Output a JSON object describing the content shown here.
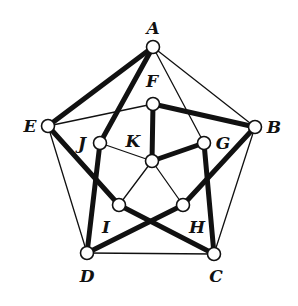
{
  "diagram": {
    "type": "graph",
    "nodes": [
      {
        "id": "A",
        "label": "A",
        "x": 153,
        "y": 47,
        "lx": 153,
        "ly": 29
      },
      {
        "id": "B",
        "label": "B",
        "x": 255,
        "y": 127,
        "lx": 274,
        "ly": 128
      },
      {
        "id": "C",
        "label": "C",
        "x": 214,
        "y": 254,
        "lx": 216,
        "ly": 277
      },
      {
        "id": "D",
        "label": "D",
        "x": 87,
        "y": 253,
        "lx": 87,
        "ly": 277
      },
      {
        "id": "E",
        "label": "E",
        "x": 48,
        "y": 126,
        "lx": 30,
        "ly": 127
      },
      {
        "id": "F",
        "label": "F",
        "x": 153,
        "y": 104,
        "lx": 152,
        "ly": 82
      },
      {
        "id": "G",
        "label": "G",
        "x": 204,
        "y": 143,
        "lx": 223,
        "ly": 144
      },
      {
        "id": "H",
        "label": "H",
        "x": 183,
        "y": 205,
        "lx": 197,
        "ly": 228
      },
      {
        "id": "I",
        "label": "I",
        "x": 119,
        "y": 205,
        "lx": 106,
        "ly": 228
      },
      {
        "id": "J",
        "label": "J",
        "x": 100,
        "y": 143,
        "lx": 82,
        "ly": 144
      },
      {
        "id": "K",
        "label": "K",
        "x": 152,
        "y": 161,
        "lx": 133,
        "ly": 142
      }
    ],
    "edges": [
      {
        "from": "A",
        "to": "E",
        "weight": "thick"
      },
      {
        "from": "A",
        "to": "J",
        "weight": "thick"
      },
      {
        "from": "F",
        "to": "B",
        "weight": "thick"
      },
      {
        "from": "F",
        "to": "K",
        "weight": "thick"
      },
      {
        "from": "K",
        "to": "G",
        "weight": "thick"
      },
      {
        "from": "E",
        "to": "I",
        "weight": "thick"
      },
      {
        "from": "I",
        "to": "C",
        "weight": "thick"
      },
      {
        "from": "J",
        "to": "D",
        "weight": "thick"
      },
      {
        "from": "H",
        "to": "D",
        "weight": "thick"
      },
      {
        "from": "B",
        "to": "H",
        "weight": "thick"
      },
      {
        "from": "G",
        "to": "C",
        "weight": "thick"
      },
      {
        "from": "A",
        "to": "B",
        "weight": "thin"
      },
      {
        "from": "A",
        "to": "G",
        "weight": "thin"
      },
      {
        "from": "E",
        "to": "F",
        "weight": "thin"
      },
      {
        "from": "E",
        "to": "D",
        "weight": "thin"
      },
      {
        "from": "D",
        "to": "C",
        "weight": "thin"
      },
      {
        "from": "B",
        "to": "C",
        "weight": "thin"
      },
      {
        "from": "J",
        "to": "K",
        "weight": "thin"
      },
      {
        "from": "K",
        "to": "I",
        "weight": "thin"
      },
      {
        "from": "K",
        "to": "H",
        "weight": "thin"
      }
    ],
    "colors": {
      "stroke": "#111111",
      "node_fill": "#ffffff",
      "background": "#ffffff"
    },
    "node_radius": 6.5
  }
}
